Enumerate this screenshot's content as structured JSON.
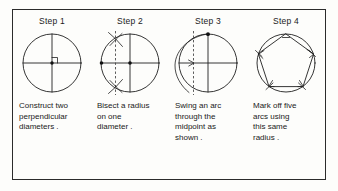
{
  "figure": {
    "border_color": "#2b2b2b",
    "ink_color": "#1f1f1f",
    "background_color": "#fdfdfb",
    "steps": [
      {
        "heading": "Step 1",
        "caption": "Construct two\nperpendicular\ndiameters .",
        "diagram_name": "circle-with-perpendicular-diameters",
        "elements": [
          "circle",
          "horizontal-diameter",
          "vertical-diameter",
          "right-angle-mark",
          "center-dot"
        ]
      },
      {
        "heading": "Step 2",
        "caption": "Bisect a radius\non one\ndiameter .",
        "diagram_name": "circle-with-bisected-radius",
        "elements": [
          "circle",
          "horizontal-diameter",
          "vertical-diameter",
          "center-dot",
          "left-endpoint-dot",
          "dashed-bisector",
          "upper-arc-cross",
          "lower-arc-cross"
        ]
      },
      {
        "heading": "Step 3",
        "caption": "Swing an arc\nthrough the\nmidpoint as\nshown .",
        "diagram_name": "circle-with-swung-arc",
        "elements": [
          "circle",
          "horizontal-diameter",
          "vertical-diameter",
          "top-dot",
          "dashed-bisector",
          "swung-arc",
          "arrowhead-at-midpoint"
        ]
      },
      {
        "heading": "Step 4",
        "caption": "Mark off five\narcs using\nthis same\nradius .",
        "diagram_name": "circle-with-inscribed-pentagon",
        "elements": [
          "circle",
          "pentagon",
          "vertex-tick-marks"
        ]
      }
    ]
  }
}
